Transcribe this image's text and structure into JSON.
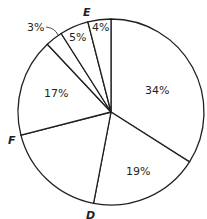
{
  "chart_data": {
    "type": "pie",
    "title": "",
    "start_angle_deg": 0,
    "direction": "clockwise",
    "slices": [
      {
        "label": "",
        "value": 34,
        "value_label": "34%"
      },
      {
        "label": "",
        "value": 19,
        "value_label": "19%"
      },
      {
        "label": "",
        "value": 18,
        "value_label": ""
      },
      {
        "label": "",
        "value": 17,
        "value_label": "17%"
      },
      {
        "label": "",
        "value": 3,
        "value_label": "3%"
      },
      {
        "label": "",
        "value": 5,
        "value_label": "5%"
      },
      {
        "label": "",
        "value": 4,
        "value_label": "4%"
      }
    ],
    "point_labels": [
      {
        "text": "D",
        "at": "boundary between 19% and unlabeled slice"
      },
      {
        "text": "F",
        "at": "boundary between unlabeled slice and 17%"
      },
      {
        "text": "E",
        "at": "boundary between 5% and 4%"
      }
    ],
    "colors": {
      "fill": "#ffffff",
      "stroke": "#231f20",
      "text": "#231f20"
    }
  },
  "labels": {
    "pct_34": "34%",
    "pct_19": "19%",
    "pct_17": "17%",
    "pct_3": "3%",
    "pct_5": "5%",
    "pct_4": "4%",
    "point_d": "D",
    "point_e": "E",
    "point_f": "F"
  }
}
